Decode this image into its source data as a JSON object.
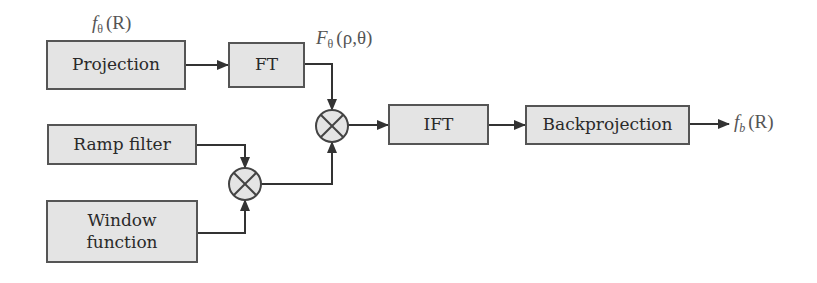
{
  "diagram": {
    "type": "block-diagram",
    "colors": {
      "box_fill": "#e4e4e4",
      "box_border": "#555555",
      "line": "#333333",
      "text": "#2a2a2a",
      "label_text": "#555555"
    },
    "blocks": [
      {
        "id": "projection",
        "label": "Projection"
      },
      {
        "id": "ft",
        "label": "FT"
      },
      {
        "id": "ramp",
        "label": "Ramp filter"
      },
      {
        "id": "window",
        "label_line1": "Window",
        "label_line2": "function"
      },
      {
        "id": "ift",
        "label": "IFT"
      },
      {
        "id": "backprojection",
        "label": "Backprojection"
      }
    ],
    "operators": [
      {
        "id": "mult-filter",
        "symbol": "multiply",
        "inputs": [
          "ramp",
          "window"
        ]
      },
      {
        "id": "mult-main",
        "symbol": "multiply",
        "inputs": [
          "ft",
          "mult-filter"
        ]
      }
    ],
    "signal_labels": {
      "input": {
        "base": "f",
        "sub": "θ",
        "arg": "(R)"
      },
      "ft_output": {
        "base": "F",
        "sub": "θ",
        "arg": "(ρ,θ)"
      },
      "output": {
        "base": "f",
        "sub": "b",
        "arg": "(R)"
      }
    },
    "edges": [
      {
        "from": "projection",
        "to": "ft"
      },
      {
        "from": "ft",
        "to": "mult-main"
      },
      {
        "from": "ramp",
        "to": "mult-filter"
      },
      {
        "from": "window",
        "to": "mult-filter"
      },
      {
        "from": "mult-filter",
        "to": "mult-main"
      },
      {
        "from": "mult-main",
        "to": "ift"
      },
      {
        "from": "ift",
        "to": "backprojection"
      },
      {
        "from": "backprojection",
        "to": "output"
      }
    ]
  }
}
